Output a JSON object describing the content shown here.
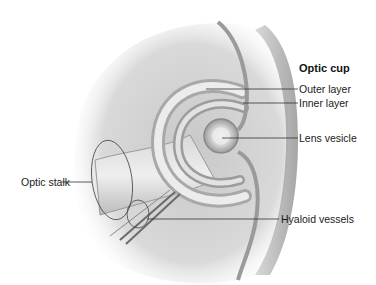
{
  "figure": {
    "title": "Optic cup",
    "labels": {
      "outer_layer": "Outer layer",
      "inner_layer": "Inner layer",
      "lens_vesicle": "Lens vesicle",
      "optic_stalk": "Optic stalk",
      "hyaloid_vessels": "Hyaloid vessels"
    },
    "colors": {
      "background": "#ffffff",
      "tissue_light": "#e6e6e6",
      "tissue_mid": "#bdbdbd",
      "tissue_dark": "#7a7a7a",
      "leader_line": "#333333"
    }
  }
}
